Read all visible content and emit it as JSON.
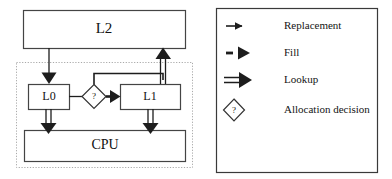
{
  "figure": {
    "colors": {
      "stroke": "#2b2b2b",
      "box_fill": "#ffffff",
      "dotted_boundary": "#b4b4b4",
      "text": "#111111",
      "legend_border": "#3a3a3a",
      "background": "#ffffff"
    },
    "diagram": {
      "boxes": [
        {
          "id": "l2",
          "label": "L2",
          "x": 23,
          "y": 10,
          "w": 162,
          "h": 38,
          "font_size": 15
        },
        {
          "id": "l0",
          "label": "L0",
          "x": 28,
          "y": 84,
          "w": 41,
          "h": 25,
          "font_size": 12
        },
        {
          "id": "l1",
          "label": "L1",
          "x": 120,
          "y": 84,
          "w": 60,
          "h": 25,
          "font_size": 12
        },
        {
          "id": "cpu",
          "label": "CPU",
          "x": 24,
          "y": 130,
          "w": 161,
          "h": 31,
          "font_size": 14
        }
      ],
      "decision": {
        "id": "allocation-decision-diamond",
        "label": "?",
        "cx": 94,
        "cy": 96,
        "rx": 12,
        "ry": 12
      },
      "boundary": {
        "id": "cpu-core-boundary",
        "x": 16,
        "y": 62,
        "w": 176,
        "h": 105,
        "style": "dotted"
      },
      "connections": [
        {
          "id": "l2-to-l0",
          "kind": "replacement",
          "from": "l2",
          "to": "l0"
        },
        {
          "id": "l1-to-l2",
          "kind": "lookup",
          "from": "l1",
          "to": "l2"
        },
        {
          "id": "l0-to-decision",
          "kind": "plain",
          "from": "l0",
          "to": "allocation-decision-diamond"
        },
        {
          "id": "decision-to-l1",
          "kind": "fill",
          "from": "allocation-decision-diamond",
          "to": "l1"
        },
        {
          "id": "decision-top-to-l1-riser",
          "kind": "plain",
          "from": "allocation-decision-diamond",
          "to": "l1-to-l2"
        },
        {
          "id": "l0-to-cpu",
          "kind": "lookup",
          "from": "l0",
          "to": "cpu"
        },
        {
          "id": "l1-to-cpu",
          "kind": "lookup",
          "from": "l1",
          "to": "cpu"
        }
      ]
    },
    "legend": {
      "box": {
        "x": 216,
        "y": 8,
        "w": 161,
        "h": 164
      },
      "items": [
        {
          "id": "replacement",
          "icon": "thin-arrow-icon",
          "label": "Replacement",
          "icon_cy": 26,
          "label_x": 284
        },
        {
          "id": "fill",
          "icon": "dashed-arrow-icon",
          "label": "Fill",
          "icon_cy": 53,
          "label_x": 284
        },
        {
          "id": "lookup",
          "icon": "double-line-arrow-icon",
          "label": "Lookup",
          "icon_cy": 80,
          "label_x": 284
        },
        {
          "id": "allocation-decision",
          "icon": "diamond-question-icon",
          "label": "Allocation decision",
          "icon_cy": 110,
          "label_x": 284
        }
      ]
    }
  }
}
